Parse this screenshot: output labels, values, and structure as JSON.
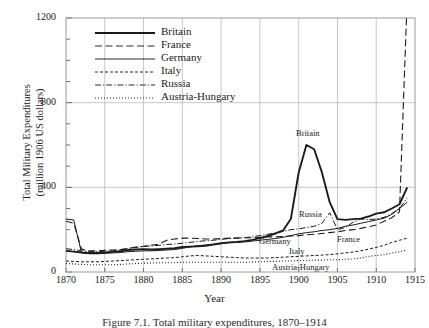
{
  "figure": {
    "caption": "Figure 7.1.  Total military expenditures, 1870–1914"
  },
  "axes": {
    "ylabel_line1": "Total Military Expenditures",
    "ylabel_line2": "(million 1906 US dollars)",
    "xlabel": "Year",
    "yticks": [
      "0",
      "400",
      "800",
      "1200"
    ],
    "xticks": [
      "1870",
      "1875",
      "1880",
      "1885",
      "1890",
      "1895",
      "1900",
      "1905",
      "1910",
      "1915"
    ]
  },
  "legend": {
    "items": [
      {
        "label": "Britain",
        "style": "solid-thick",
        "color": "#1a1a1a"
      },
      {
        "label": "France",
        "style": "long-dash",
        "color": "#2a2a2a"
      },
      {
        "label": "Germany",
        "style": "solid-thin",
        "color": "#2a2a2a"
      },
      {
        "label": "Italy",
        "style": "short-dash",
        "color": "#2a2a2a"
      },
      {
        "label": "Russia",
        "style": "dash-dot",
        "color": "#2a2a2a"
      },
      {
        "label": "Austria-Hungary",
        "style": "dotted",
        "color": "#2a2a2a"
      }
    ]
  },
  "inline_labels": [
    {
      "name": "Britain",
      "x": 296,
      "y": 128
    },
    {
      "name": "Russia",
      "x": 299,
      "y": 209
    },
    {
      "name": "France",
      "x": 337,
      "y": 234
    },
    {
      "name": "Germany",
      "x": 259,
      "y": 236
    },
    {
      "name": "Italy",
      "x": 289,
      "y": 246
    },
    {
      "name": "Austria-Hungary",
      "x": 272,
      "y": 262
    }
  ],
  "chart_data": {
    "type": "line",
    "title": "",
    "xlabel": "Year",
    "ylabel": "Total Military Expenditures (million 1906 US dollars)",
    "xlim": [
      1870,
      1915
    ],
    "ylim": [
      0,
      1200
    ],
    "yticks": [
      0,
      400,
      800,
      1200
    ],
    "xticks": [
      1870,
      1875,
      1880,
      1885,
      1890,
      1895,
      1900,
      1905,
      1910,
      1915
    ],
    "grid": true,
    "legend_position": "upper-left-inside",
    "series": [
      {
        "name": "Britain",
        "style": "solid-thick",
        "x": [
          1870,
          1871,
          1872,
          1873,
          1874,
          1875,
          1876,
          1877,
          1878,
          1879,
          1880,
          1881,
          1882,
          1883,
          1884,
          1885,
          1886,
          1887,
          1888,
          1889,
          1890,
          1891,
          1892,
          1893,
          1894,
          1895,
          1896,
          1897,
          1898,
          1899,
          1900,
          1901,
          1902,
          1903,
          1904,
          1905,
          1906,
          1907,
          1908,
          1909,
          1910,
          1911,
          1912,
          1913,
          1914
        ],
        "y": [
          100,
          96,
          92,
          90,
          90,
          92,
          95,
          98,
          104,
          106,
          108,
          106,
          108,
          110,
          112,
          118,
          120,
          122,
          124,
          130,
          136,
          140,
          142,
          146,
          152,
          160,
          170,
          182,
          196,
          252,
          470,
          600,
          580,
          470,
          330,
          250,
          246,
          250,
          252,
          262,
          276,
          282,
          300,
          320,
          400
        ]
      },
      {
        "name": "France",
        "style": "long-dash",
        "x": [
          1870,
          1871,
          1872,
          1873,
          1874,
          1875,
          1876,
          1877,
          1878,
          1879,
          1880,
          1881,
          1882,
          1883,
          1884,
          1885,
          1886,
          1887,
          1888,
          1889,
          1890,
          1891,
          1892,
          1893,
          1894,
          1895,
          1896,
          1897,
          1898,
          1899,
          1900,
          1901,
          1902,
          1903,
          1904,
          1905,
          1906,
          1907,
          1908,
          1909,
          1910,
          1911,
          1912,
          1913,
          1914
        ],
        "y": [
          240,
          230,
          108,
          100,
          100,
          102,
          104,
          106,
          112,
          118,
          122,
          126,
          132,
          150,
          156,
          160,
          160,
          158,
          156,
          156,
          158,
          160,
          160,
          162,
          162,
          164,
          166,
          166,
          168,
          170,
          172,
          176,
          178,
          182,
          186,
          190,
          196,
          200,
          206,
          214,
          222,
          240,
          256,
          284,
          1300
        ]
      },
      {
        "name": "Germany",
        "style": "solid-thin",
        "x": [
          1870,
          1871,
          1872,
          1873,
          1874,
          1875,
          1876,
          1877,
          1878,
          1879,
          1880,
          1881,
          1882,
          1883,
          1884,
          1885,
          1886,
          1887,
          1888,
          1889,
          1890,
          1891,
          1892,
          1893,
          1894,
          1895,
          1896,
          1897,
          1898,
          1899,
          1900,
          1901,
          1902,
          1903,
          1904,
          1905,
          1906,
          1907,
          1908,
          1909,
          1910,
          1911,
          1912,
          1913,
          1914
        ],
        "y": [
          250,
          246,
          90,
          86,
          86,
          88,
          90,
          92,
          96,
          98,
          100,
          100,
          102,
          104,
          106,
          112,
          118,
          124,
          128,
          130,
          134,
          138,
          140,
          142,
          146,
          150,
          154,
          158,
          164,
          172,
          180,
          186,
          190,
          196,
          200,
          206,
          216,
          222,
          230,
          238,
          246,
          254,
          272,
          300,
          330
        ]
      },
      {
        "name": "Italy",
        "style": "short-dash",
        "x": [
          1870,
          1871,
          1872,
          1873,
          1874,
          1875,
          1876,
          1877,
          1878,
          1879,
          1880,
          1881,
          1882,
          1883,
          1884,
          1885,
          1886,
          1887,
          1888,
          1889,
          1890,
          1891,
          1892,
          1893,
          1894,
          1895,
          1896,
          1897,
          1898,
          1899,
          1900,
          1901,
          1902,
          1903,
          1904,
          1905,
          1906,
          1907,
          1908,
          1909,
          1910,
          1911,
          1912,
          1913,
          1914
        ],
        "y": [
          52,
          50,
          48,
          48,
          48,
          50,
          52,
          54,
          56,
          58,
          60,
          62,
          64,
          66,
          68,
          72,
          76,
          78,
          76,
          74,
          72,
          70,
          68,
          66,
          66,
          66,
          66,
          68,
          70,
          72,
          74,
          76,
          78,
          80,
          82,
          86,
          90,
          94,
          100,
          108,
          116,
          126,
          140,
          150,
          160
        ]
      },
      {
        "name": "Russia",
        "style": "dash-dot",
        "x": [
          1870,
          1871,
          1872,
          1873,
          1874,
          1875,
          1876,
          1877,
          1878,
          1879,
          1880,
          1881,
          1882,
          1883,
          1884,
          1885,
          1886,
          1887,
          1888,
          1889,
          1890,
          1891,
          1892,
          1893,
          1894,
          1895,
          1896,
          1897,
          1898,
          1899,
          1900,
          1901,
          1902,
          1903,
          1904,
          1905,
          1906,
          1907,
          1908,
          1909,
          1910,
          1911,
          1912,
          1913,
          1914
        ],
        "y": [
          110,
          106,
          100,
          96,
          96,
          98,
          100,
          104,
          110,
          116,
          120,
          124,
          126,
          130,
          132,
          136,
          140,
          144,
          148,
          150,
          154,
          158,
          160,
          162,
          166,
          172,
          178,
          184,
          192,
          200,
          204,
          210,
          216,
          230,
          280,
          200,
          210,
          235,
          250,
          248,
          250,
          258,
          276,
          300,
          350
        ]
      },
      {
        "name": "Austria-Hungary",
        "style": "dotted",
        "x": [
          1870,
          1871,
          1872,
          1873,
          1874,
          1875,
          1876,
          1877,
          1878,
          1879,
          1880,
          1881,
          1882,
          1883,
          1884,
          1885,
          1886,
          1887,
          1888,
          1889,
          1890,
          1891,
          1892,
          1893,
          1894,
          1895,
          1896,
          1897,
          1898,
          1899,
          1900,
          1901,
          1902,
          1903,
          1904,
          1905,
          1906,
          1907,
          1908,
          1909,
          1910,
          1911,
          1912,
          1913,
          1914
        ],
        "y": [
          40,
          38,
          36,
          34,
          34,
          34,
          34,
          36,
          38,
          40,
          42,
          42,
          44,
          44,
          44,
          46,
          46,
          46,
          46,
          46,
          46,
          46,
          46,
          46,
          48,
          48,
          50,
          50,
          52,
          52,
          54,
          54,
          56,
          56,
          58,
          58,
          60,
          62,
          66,
          74,
          78,
          82,
          90,
          96,
          104
        ]
      }
    ]
  }
}
